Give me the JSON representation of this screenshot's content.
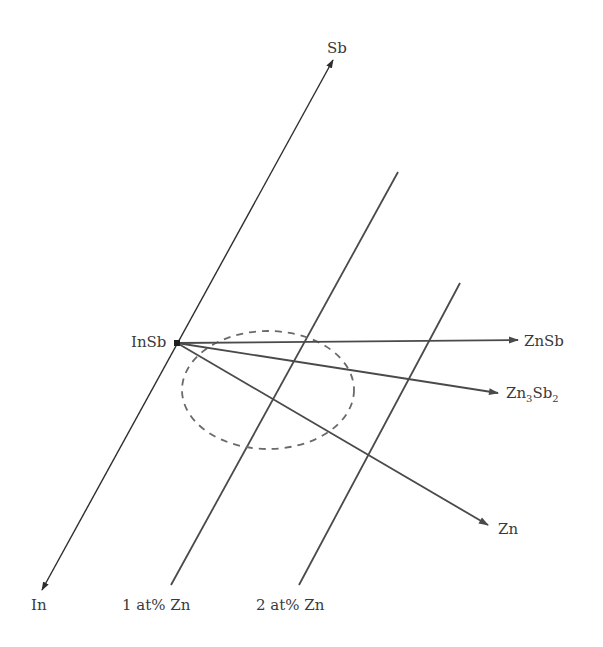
{
  "diagram": {
    "type": "composition-direction diagram",
    "labels": {
      "sb": "Sb",
      "in": "In",
      "insb": "InSb",
      "znsb": "ZnSb",
      "zn3sb2_base": "Zn",
      "zn3sb2_sub1": "3",
      "zn3sb2_mid": "Sb",
      "zn3sb2_sub2": "2",
      "zn": "Zn",
      "line1": "1 at% Zn",
      "line2": "2 at% Zn"
    },
    "colors": {
      "line": "#4a4a4a",
      "axis": "#2e2e2e",
      "dashed": "#6a6a6a",
      "text": "#3a3a3a",
      "background": "#ffffff"
    },
    "points": {
      "insb": [
        177,
        343
      ],
      "sb_tip": [
        333,
        60
      ],
      "in_tip": [
        42,
        590
      ],
      "line1_top": [
        398,
        172
      ],
      "line1_bottom": [
        171,
        585
      ],
      "line2_top": [
        460,
        283
      ],
      "line2_bottom": [
        299,
        585
      ],
      "znsb_tip": [
        518,
        340
      ],
      "zn3sb2_tip": [
        498,
        393
      ],
      "zn_tip": [
        488,
        525
      ]
    },
    "dashed_region": {
      "shape": "ellipse",
      "cx": 268,
      "cy": 390,
      "rx": 86,
      "ry": 59
    }
  }
}
